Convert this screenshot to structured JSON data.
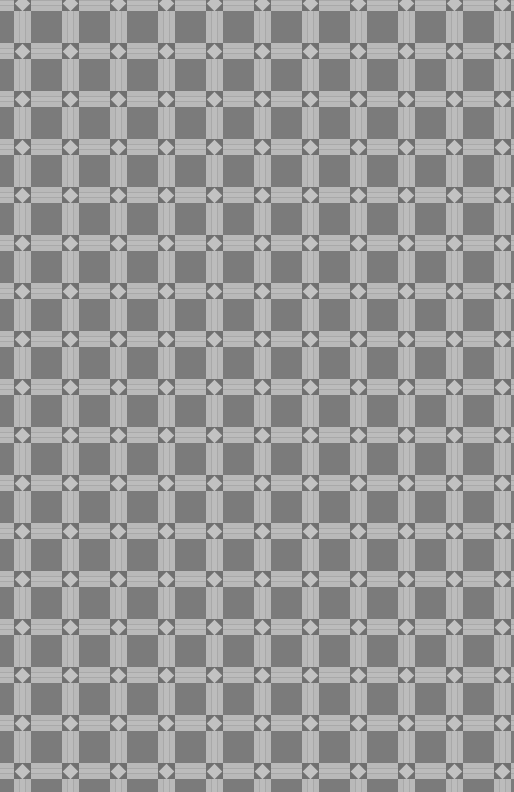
{
  "pattern": {
    "description": "Repeating gray lattice with light bands and diamond intersections",
    "period_px": 48,
    "vband_offset_x": 14,
    "hband_offset_y": 43,
    "colors": {
      "background": "#7b7b7b",
      "band": "#b9b9b9",
      "node": "#707070",
      "diamond": "#c2c2c2"
    }
  }
}
